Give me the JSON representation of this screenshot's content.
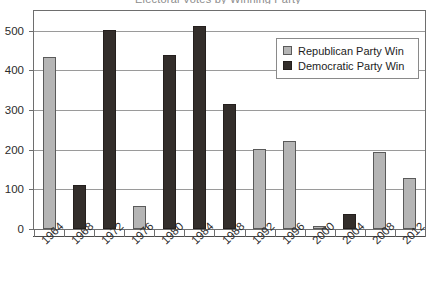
{
  "chart_data": {
    "type": "bar",
    "title": "Electoral Votes by Winning Party",
    "xlabel": "",
    "ylabel": "",
    "ylim": [
      0,
      550
    ],
    "yticks": [
      0,
      100,
      200,
      300,
      400,
      500
    ],
    "grid": true,
    "legend_position": "top-right",
    "categories": [
      "1964",
      "1968",
      "1972",
      "1976",
      "1980",
      "1984",
      "1988",
      "1992",
      "1996",
      "2000",
      "2004",
      "2008",
      "2012"
    ],
    "series": [
      {
        "name": "Republican Party Win",
        "color": "#b5b5b5",
        "values": [
          433,
          null,
          null,
          58,
          null,
          null,
          null,
          203,
          222,
          7,
          null,
          195,
          128
        ]
      },
      {
        "name": "Democratic Party Win",
        "color": "#332e2b",
        "values": [
          null,
          111,
          503,
          null,
          440,
          513,
          315,
          null,
          null,
          null,
          39,
          null,
          null
        ]
      }
    ],
    "bars": [
      {
        "category": "1964",
        "value": 433,
        "party": "rep"
      },
      {
        "category": "1968",
        "value": 111,
        "party": "dem"
      },
      {
        "category": "1972",
        "value": 503,
        "party": "dem"
      },
      {
        "category": "1976",
        "value": 58,
        "party": "rep"
      },
      {
        "category": "1980",
        "value": 440,
        "party": "dem"
      },
      {
        "category": "1984",
        "value": 513,
        "party": "dem"
      },
      {
        "category": "1988",
        "value": 315,
        "party": "dem"
      },
      {
        "category": "1992",
        "value": 203,
        "party": "rep"
      },
      {
        "category": "1996",
        "value": 222,
        "party": "rep"
      },
      {
        "category": "2000",
        "value": 7,
        "party": "rep"
      },
      {
        "category": "2004",
        "value": 39,
        "party": "dem"
      },
      {
        "category": "2008",
        "value": 195,
        "party": "rep"
      },
      {
        "category": "2012",
        "value": 128,
        "party": "rep"
      }
    ]
  },
  "legend": {
    "items": [
      {
        "label": "Republican Party Win",
        "party": "rep"
      },
      {
        "label": "Democratic Party Win",
        "party": "dem"
      }
    ]
  },
  "colors": {
    "republican": "#b5b5b5",
    "democratic": "#332e2b",
    "gridline": "#9a9a9a",
    "frame": "#6e6e6e",
    "text": "#2b2b2b"
  }
}
